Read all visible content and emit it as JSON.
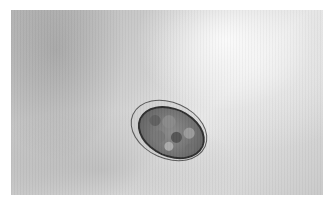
{
  "image": {
    "description": "Grayscale light micrograph of a single oval, thin-shelled parasite egg containing a segmented (morula-stage) embryo, on a mottled grey background",
    "subject": "oval egg with segmented embryo",
    "colors": {
      "border": "#ffffff",
      "background_light": "#e6e6e6",
      "background_dark": "#b9b9b9",
      "egg_outline": "#2e2e2e"
    }
  }
}
